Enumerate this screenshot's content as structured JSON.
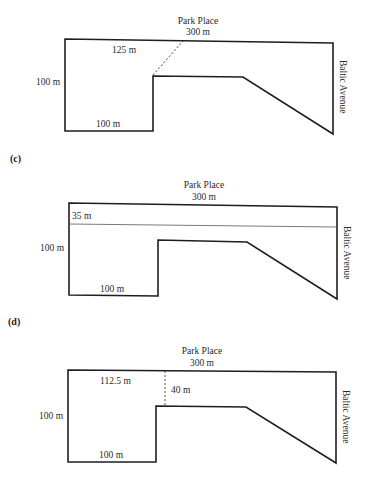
{
  "figures": [
    {
      "id": "b",
      "part_label": "",
      "top_street": "Park Place",
      "top_length": "300 m",
      "right_street": "Baltic Avenue",
      "left_length": "100 m",
      "bottom_length": "100 m",
      "annotation_1": "125 m",
      "annotation_2": ""
    },
    {
      "id": "c",
      "part_label": "(c)",
      "top_street": "Park Place",
      "top_length": "300 m",
      "right_street": "Baltic Avenue",
      "left_length": "100 m",
      "bottom_length": "100 m",
      "annotation_1": "35 m",
      "annotation_2": ""
    },
    {
      "id": "d",
      "part_label": "(d)",
      "top_street": "Park Place",
      "top_length": "300 m",
      "right_street": "Baltic Avenue",
      "left_length": "100 m",
      "bottom_length": "100 m",
      "annotation_1": "112.5 m",
      "annotation_2": "40 m"
    }
  ]
}
